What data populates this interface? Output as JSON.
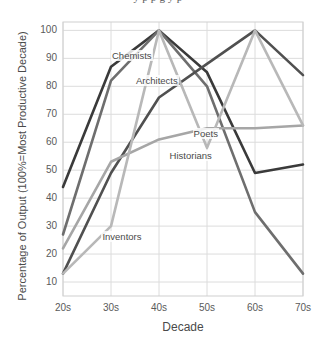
{
  "top_caption_cropped": "y p                    p g       y     p",
  "chart_data": {
    "type": "line",
    "title": "",
    "xlabel": "Decade",
    "ylabel": "Percentage of Output (100%=Most Productive Decade)",
    "categories": [
      "20s",
      "30s",
      "40s",
      "50s",
      "60s",
      "70s"
    ],
    "x_tick_labels": [
      "20s",
      "30s",
      "40s",
      "50s",
      "60s",
      "70s"
    ],
    "y_tick_labels": [
      "10",
      "20",
      "30",
      "40",
      "50",
      "60",
      "70",
      "80",
      "90",
      "100"
    ],
    "y_tick_values": [
      10,
      20,
      30,
      40,
      50,
      60,
      70,
      80,
      90,
      100
    ],
    "ylim": [
      5,
      103
    ],
    "grid": true,
    "legend_position": "inline-labels",
    "series": [
      {
        "name": "Chemists",
        "color": "#3a3a3a",
        "values": [
          44,
          87,
          100,
          85,
          49,
          52
        ],
        "label_x": "30s",
        "label_y": 91
      },
      {
        "name": "Architects",
        "color": "#6e6e6e",
        "values": [
          27,
          82,
          100,
          80,
          35,
          13
        ],
        "label_x": "35s",
        "label_y": 82
      },
      {
        "name": "Poets",
        "color": "#505050",
        "values": [
          13,
          49,
          76,
          88,
          100,
          84
        ],
        "label_x": "47s",
        "label_y": 63
      },
      {
        "name": "Historians",
        "color": "#a6a6a6",
        "values": [
          22,
          53,
          61,
          65,
          65,
          66
        ],
        "label_x": "42s",
        "label_y": 55
      },
      {
        "name": "Inventors",
        "color": "#b8b8b8",
        "values": [
          13,
          30,
          100,
          58,
          100,
          66
        ],
        "label_x": "28s",
        "label_y": 26
      }
    ]
  }
}
